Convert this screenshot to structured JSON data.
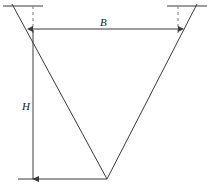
{
  "figure": {
    "type": "engineering-diagram",
    "labels": {
      "width_label": "B",
      "depth_label": "H"
    },
    "colors": {
      "line": "#3a3a3a",
      "dashed": "#7a7a7a",
      "background": "#ffffff",
      "text": "#1a1a1a"
    },
    "geometry": {
      "ground_line_left": {
        "x1": 3,
        "y1": 6,
        "x2": 43,
        "y2": 6
      },
      "ground_line_right": {
        "x1": 167,
        "y1": 6,
        "x2": 207,
        "y2": 6
      },
      "dashed_left": {
        "x": 33,
        "y1": 6,
        "y2": 33
      },
      "dashed_right": {
        "x": 178,
        "y1": 6,
        "y2": 33
      },
      "slope_left": {
        "x1": 12,
        "y1": 4,
        "x2": 107,
        "y2": 179
      },
      "slope_right": {
        "x1": 197,
        "y1": 4,
        "x2": 107,
        "y2": 179
      },
      "dimension_B": {
        "y": 29,
        "x1": 33,
        "x2": 178
      },
      "dimension_H": {
        "x": 33,
        "y1": 30,
        "y2": 179
      },
      "bottom_line": {
        "x1": 18,
        "y1": 179,
        "x2": 107,
        "y2": 179
      },
      "apex": {
        "x": 107,
        "y": 179
      }
    }
  }
}
